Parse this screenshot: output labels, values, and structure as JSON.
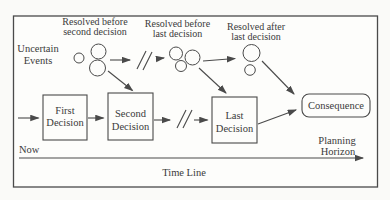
{
  "figure": {
    "uncertain_events_label": {
      "line1": "Uncertain",
      "line2": "Events"
    },
    "resolution_labels": {
      "before_second": {
        "line1": "Resolved before",
        "line2": "second decision"
      },
      "before_last": {
        "line1": "Resolved before",
        "line2": "last decision"
      },
      "after_last": {
        "line1": "Resolved after",
        "line2": "last decision"
      }
    },
    "decision_boxes": {
      "first": {
        "line1": "First",
        "line2": "Decision"
      },
      "second": {
        "line1": "Second",
        "line2": "Decision"
      },
      "last": {
        "line1": "Last",
        "line2": "Decision"
      },
      "consequence": "Consequence"
    },
    "timeline": {
      "now": "Now",
      "planning": {
        "line1": "Planning",
        "line2": "Horizon"
      },
      "axis_title": "Time Line"
    },
    "colors": {
      "ink": "#3a3a3a",
      "line": "#4a4a4a",
      "paper": "#fdfdfb"
    }
  }
}
